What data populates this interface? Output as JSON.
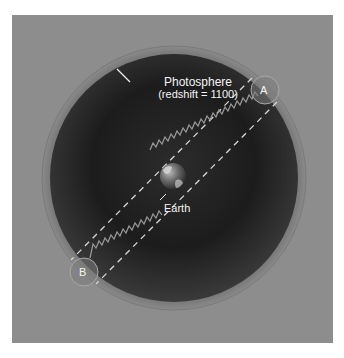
{
  "diagram": {
    "labels": {
      "photosphere": "Photosphere",
      "redshift": "(redshift = 1100)",
      "earth": "Earth",
      "point_a": "A",
      "point_b": "B"
    },
    "colors": {
      "panel": "#8d8d8d",
      "photosphere_ring": "#5e5e5e",
      "interior": "#1e1e1e",
      "label": "#f4f4f4"
    }
  }
}
